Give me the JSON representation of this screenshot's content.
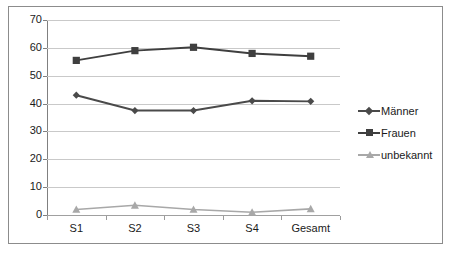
{
  "chart_data": {
    "type": "line",
    "title": "",
    "subtitle": "",
    "xlabel": "",
    "ylabel": "",
    "categories": [
      "S1",
      "S2",
      "S3",
      "S4",
      "Gesamt"
    ],
    "ylim": [
      0,
      70
    ],
    "y_ticks": [
      0,
      10,
      20,
      30,
      40,
      50,
      60,
      70
    ],
    "y_tick_labels": [
      "0",
      "10",
      "20",
      "30",
      "40",
      "50",
      "60",
      "70"
    ],
    "grid": true,
    "legend_position": "right",
    "series": [
      {
        "name": "Männer",
        "marker": "diamond",
        "color": "#4a4a4a",
        "values": [
          43,
          37.5,
          37.5,
          41,
          40.8
        ]
      },
      {
        "name": "Frauen",
        "marker": "square",
        "color": "#3f3f3f",
        "values": [
          55.5,
          59,
          60.2,
          58,
          57
        ]
      },
      {
        "name": "unbekannt",
        "marker": "triangle",
        "color": "#a8a8a8",
        "values": [
          2,
          3.5,
          2,
          1,
          2.2
        ]
      }
    ]
  },
  "legend": {
    "entries": [
      {
        "label": "Männer"
      },
      {
        "label": "Frauen"
      },
      {
        "label": "unbekannt"
      }
    ]
  },
  "colors": {
    "frame": "#8c8c8c",
    "gridline": "#c9c9c9",
    "axis": "#808080",
    "text": "#1a1a1a",
    "series_maenner": "#4a4a4a",
    "series_frauen": "#3f3f3f",
    "series_unbekannt": "#a8a8a8",
    "background": "#ffffff"
  }
}
